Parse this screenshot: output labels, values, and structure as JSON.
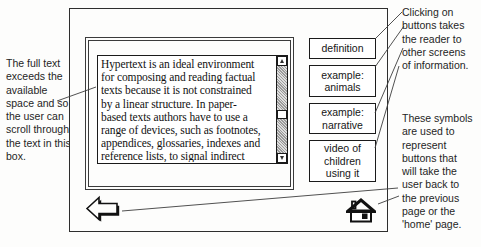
{
  "annotations": {
    "left": {
      "lines": [
        "The full text",
        "exceeds the",
        "available",
        "space and so",
        "the user can",
        "scroll through",
        "the text in this",
        "box."
      ]
    },
    "buttons_note": {
      "lines": [
        "Clicking on",
        "buttons takes",
        "the reader to",
        "other screens",
        "of information."
      ]
    },
    "symbols_note": {
      "lines": [
        "These symbols",
        "are used to",
        "represent",
        "buttons that",
        "will take the",
        "user back to",
        "the previous",
        "page or the",
        "'home' page."
      ]
    }
  },
  "screen": {
    "textbox": {
      "content_lines": [
        "Hypertext is an ideal environment",
        "for composing and reading factual",
        "texts because it is not constrained",
        "by a linear structure. In paper-",
        "based texts authors have to use a",
        "range of devices, such as footnotes,",
        "appendices, glossaries, indexes and",
        "reference lists, to signal indirect"
      ]
    },
    "scrollbar": {
      "up_icon": "scroll-up-arrow",
      "down_icon": "scroll-down-arrow"
    },
    "buttons": [
      {
        "label_lines": [
          "definition"
        ]
      },
      {
        "label_lines": [
          "example:",
          "animals"
        ]
      },
      {
        "label_lines": [
          "example:",
          "narrative"
        ]
      },
      {
        "label_lines": [
          "video of",
          "children",
          "using it"
        ]
      }
    ],
    "nav": {
      "back_icon": "back-arrow",
      "home_icon": "home"
    }
  },
  "colors": {
    "ink": "#1a1a1a",
    "leader_line": "#3d3d3d",
    "scroll_track_gray": "#b5b5b5"
  }
}
